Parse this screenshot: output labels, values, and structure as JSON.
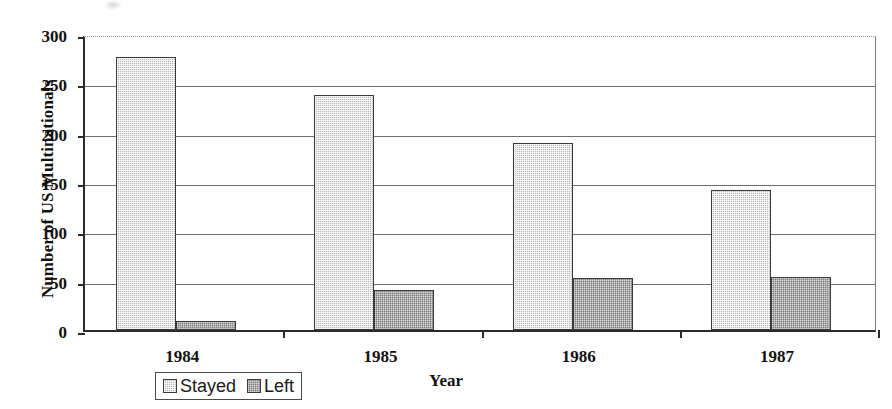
{
  "chart_data": {
    "type": "bar",
    "title": "",
    "xlabel": "Year",
    "ylabel": "Number of US Multinationals",
    "categories": [
      "1984",
      "1985",
      "1986",
      "1987"
    ],
    "series": [
      {
        "name": "Stayed",
        "values": [
          277,
          238,
          190,
          142
        ],
        "color": "#b9b9b9"
      },
      {
        "name": "Left",
        "values": [
          9,
          41,
          53,
          54
        ],
        "color": "#7d7d7d"
      }
    ],
    "ylim": [
      0,
      300
    ],
    "yticks": [
      0,
      50,
      100,
      150,
      200,
      250,
      300
    ],
    "ytick_labels": [
      "0",
      "50",
      "100",
      "150",
      "200",
      "250",
      "300"
    ],
    "grid": true,
    "grid_axis": "y",
    "legend_position": "bottom-left",
    "legend_entries": [
      "Stayed",
      "Left"
    ]
  }
}
